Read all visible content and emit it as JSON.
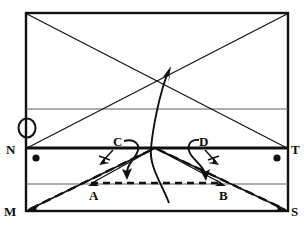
{
  "figure": {
    "type": "optics-ray-diagram",
    "background_color": "#ffffff",
    "ink_color": "#111111",
    "grid_color": "#6b6b6b",
    "canvas": {
      "width": 304,
      "height": 225
    }
  },
  "frame": {
    "name": "outer-rectangle",
    "left": 26,
    "top": 13,
    "right": 288,
    "bottom": 211,
    "stroke_width": 2.2
  },
  "horizontal_lines": [
    {
      "name": "upper-gridline",
      "y": 109,
      "x1": 26,
      "x2": 288,
      "stroke_width": 1.0,
      "style": "thin"
    },
    {
      "name": "interface-line-NT",
      "y": 148,
      "x1": 26,
      "x2": 288,
      "stroke_width": 3.0,
      "style": "thick"
    },
    {
      "name": "lower-gridline",
      "y": 184,
      "x1": 26,
      "x2": 288,
      "stroke_width": 1.0,
      "style": "thin"
    }
  ],
  "labels": [
    {
      "id": "N",
      "text": "N",
      "x": 10,
      "y": 153,
      "size": "large"
    },
    {
      "id": "T",
      "text": "T",
      "x": 291,
      "y": 153,
      "size": "large"
    },
    {
      "id": "M",
      "text": "M",
      "x": 8,
      "y": 215,
      "size": "large"
    },
    {
      "id": "S",
      "text": "S",
      "x": 291,
      "y": 215,
      "size": "large"
    },
    {
      "id": "A",
      "text": "A",
      "x": 91,
      "y": 199,
      "size": "large"
    },
    {
      "id": "B",
      "text": "B",
      "x": 220,
      "y": 199,
      "size": "large"
    },
    {
      "id": "C",
      "text": "C",
      "x": 115,
      "y": 144,
      "size": "large"
    },
    {
      "id": "D",
      "text": "D",
      "x": 200,
      "y": 144,
      "size": "large"
    }
  ],
  "points": [
    {
      "name": "dot-left-on-NT",
      "x": 36,
      "y": 158,
      "r": 3.4
    },
    {
      "name": "dot-right-on-NT",
      "x": 277,
      "y": 158,
      "r": 3.4
    },
    {
      "name": "circle-O-left-edge",
      "x": 26,
      "y": 128,
      "rx": 8,
      "ry": 9,
      "filled": false
    }
  ],
  "rays": [
    {
      "name": "ray-topleft-to-T",
      "x1": 26,
      "y1": 13,
      "x2": 288,
      "y2": 148
    },
    {
      "name": "ray-N-to-topright",
      "x1": 26,
      "y1": 148,
      "x2": 288,
      "y2": 13
    },
    {
      "name": "ray-M-to-B-extended",
      "x1": 26,
      "y1": 211,
      "x2": 155,
      "y2": 148
    },
    {
      "name": "ray-center-to-S",
      "x1": 155,
      "y1": 148,
      "x2": 288,
      "y2": 211
    },
    {
      "name": "ray-A-to-center",
      "x1": 91,
      "y1": 184,
      "x2": 155,
      "y2": 148
    },
    {
      "name": "ray-center-to-B",
      "x1": 155,
      "y1": 148,
      "x2": 220,
      "y2": 184
    }
  ],
  "dashed_segments": [
    {
      "name": "dashed-A-to-B",
      "x1": 91,
      "y1": 183,
      "x2": 222,
      "y2": 183,
      "dash": "7,5"
    },
    {
      "name": "dashed-ray-M-to-center",
      "x1": 28,
      "y1": 210,
      "x2": 155,
      "y2": 149,
      "dash": "8,4"
    },
    {
      "name": "dashed-ray-center-to-S",
      "x1": 155,
      "y1": 149,
      "x2": 286,
      "y2": 210,
      "dash": "8,4"
    }
  ],
  "arrows": [
    {
      "name": "arrow-upward-refracted",
      "description": "long curved ray leaving bottom, bending through interface, arrowhead up-right",
      "head_x": 170,
      "head_y": 67
    },
    {
      "name": "arrow-C-down-right",
      "description": "arrow from C curving down to the right",
      "head_x": 127,
      "head_y": 178
    },
    {
      "name": "arrow-D-down-right",
      "description": "arrow from D curving down to the right",
      "head_x": 206,
      "head_y": 178
    },
    {
      "name": "arrow-to-A",
      "description": "arrow pointing down-left toward A",
      "head_x": 92,
      "head_y": 183
    },
    {
      "name": "arrow-to-B",
      "description": "arrow pointing down-right toward B",
      "head_x": 221,
      "head_y": 183
    },
    {
      "name": "arrow-small-left-of-C",
      "description": "small tick arrow left of C",
      "head_x": 104,
      "head_y": 161
    },
    {
      "name": "arrow-small-right-of-D",
      "description": "small tick arrow right of D",
      "head_x": 216,
      "head_y": 161
    },
    {
      "name": "arrow-M-corner",
      "description": "arrowhead at M corner pointing down-left",
      "head_x": 28,
      "head_y": 210
    },
    {
      "name": "arrow-S-corner",
      "description": "arrowhead at S corner pointing down-right",
      "head_x": 286,
      "head_y": 210
    }
  ],
  "curves": [
    {
      "name": "main-refracted-curve",
      "path": "M 168 202 C 162 182, 150 166, 152 148 C 154 128, 160 96, 170 70"
    },
    {
      "name": "loop-C",
      "path": "M 126 141 C 136 139, 140 146, 136 153 C 132 160, 124 166, 126 176"
    },
    {
      "name": "loop-D",
      "path": "M 197 141 C 190 141, 188 148, 192 155 C 197 163, 204 168, 204 176"
    }
  ]
}
